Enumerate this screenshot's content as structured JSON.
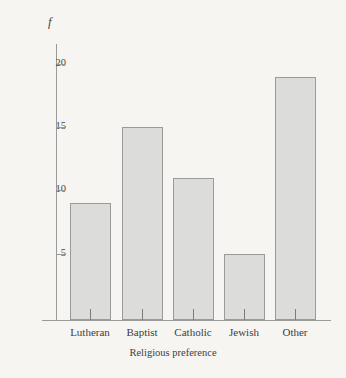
{
  "chart_data": {
    "type": "bar",
    "title": "",
    "subtitle": "",
    "xlabel": "Religious preference",
    "ylabel": "f",
    "categories": [
      "Lutheran",
      "Baptist",
      "Catholic",
      "Jewish",
      "Other"
    ],
    "values": [
      9,
      15,
      11,
      5,
      19
    ],
    "yticks": [
      5,
      10,
      15,
      20
    ],
    "ytick_labels": [
      "5",
      "10",
      "15",
      "20"
    ],
    "ylim": [
      0,
      21.7
    ],
    "xlim": [
      0,
      5
    ],
    "grid": false,
    "legend": null,
    "annotations": [],
    "series": [
      {
        "name": "Frequency",
        "values": [
          9,
          15,
          11,
          5,
          19
        ]
      }
    ],
    "bars": [
      {
        "label": "Lutheran",
        "value": 9
      },
      {
        "label": "Baptist",
        "value": 15
      },
      {
        "label": "Catholic",
        "value": 11
      },
      {
        "label": "Jewish",
        "value": 5
      },
      {
        "label": "Other",
        "value": 19
      }
    ]
  },
  "style": {
    "background": "#f6f5f2",
    "bar_fill": "#dcdcda",
    "bar_border": "#9a9a98",
    "axis_color": "#9a9a98",
    "text_color": "#3f3d3b"
  }
}
